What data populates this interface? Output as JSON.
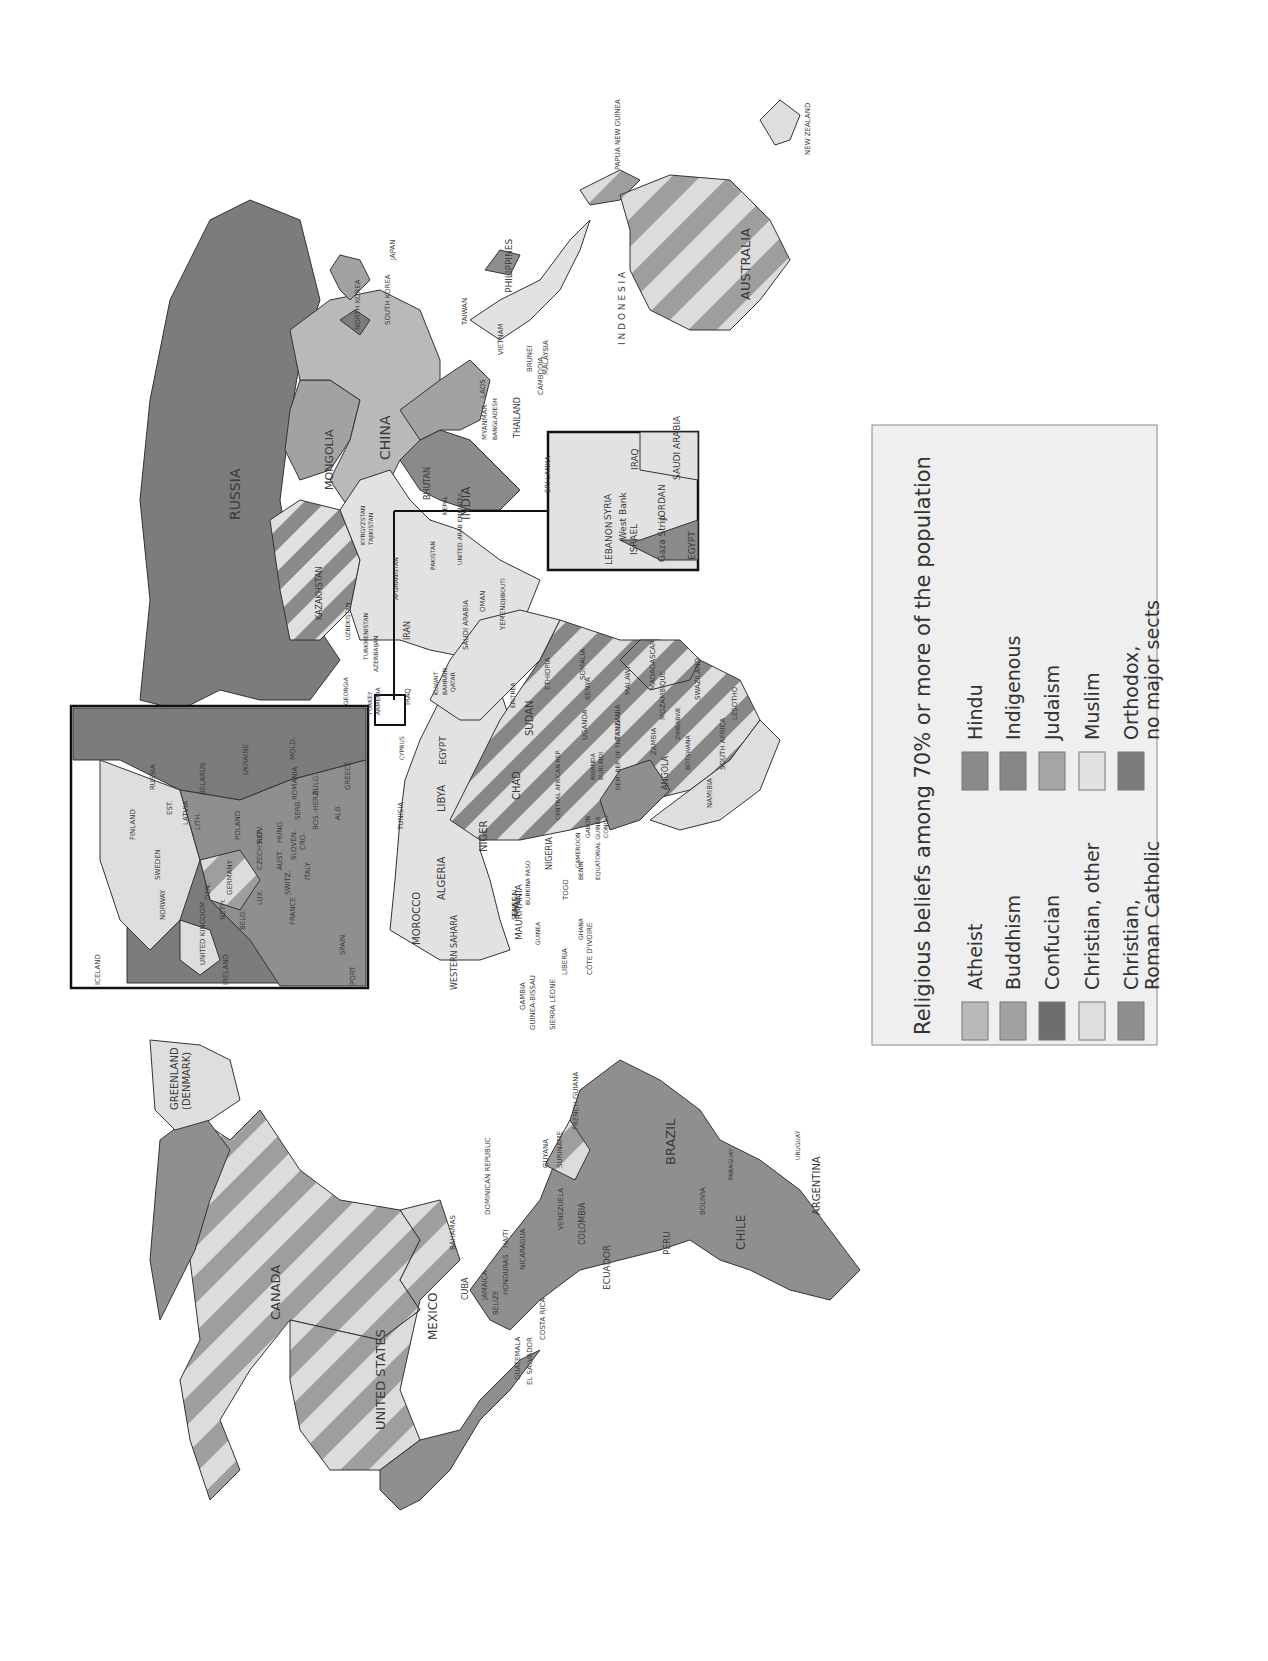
{
  "colors": {
    "atheist": "#b9b9b9",
    "buddhism": "#a2a2a2",
    "confucian": "#6e6e6e",
    "christian_other": "#dedede",
    "roman_catholic": "#8f8f8f",
    "hindu": "#8a8a8a",
    "indigenous": "#868686",
    "judaism": "#a5a5a5",
    "muslim": "#e2e2e2",
    "orthodox": "#7c7c7c",
    "stripe_a": "#9e9e9e",
    "stripe_b": "#dcdcdc",
    "legend_bg": "#efefef",
    "border": "#222222"
  },
  "legend": {
    "title": "Religious beliefs among 70% or more of the population",
    "items": [
      {
        "key": "atheist",
        "label": "Atheist"
      },
      {
        "key": "buddhism",
        "label": "Buddhism"
      },
      {
        "key": "confucian",
        "label": "Confucian"
      },
      {
        "key": "christian_other",
        "label": "Christian, other"
      },
      {
        "key": "roman_catholic",
        "label": "Christian,",
        "label2": "Roman Catholic"
      },
      {
        "key": "hindu",
        "label": "Hindu"
      },
      {
        "key": "indigenous",
        "label": "Indigenous"
      },
      {
        "key": "judaism",
        "label": "Judaism"
      },
      {
        "key": "muslim",
        "label": "Muslim"
      },
      {
        "key": "orthodox",
        "label": "Orthodox,",
        "label2": "no major sects"
      }
    ]
  },
  "countries": {
    "canada": "CANADA",
    "united_states": "UNITED STATES",
    "mexico": "MEXICO",
    "greenland": "GREENLAND",
    "greenland2": "(DENMARK)",
    "cuba": "CUBA",
    "bahamas": "BAHAMAS",
    "dominican_republic": "DOMINICAN REPUBLIC",
    "jamaica": "JAMAICA",
    "haiti": "HAITI",
    "honduras": "HONDURAS",
    "belize": "BELIZE",
    "nicaragua": "NICARAGUA",
    "guatemala": "GUATEMALA",
    "el_salvador": "EL SALVADOR",
    "costa_rica": "COSTA RICA",
    "panama": "PANAMA",
    "venezuela": "VENEZUELA",
    "guyana": "GUYANA",
    "suriname": "SURINAME",
    "french_guiana": "FRENCH GUIANA",
    "colombia": "COLOMBIA",
    "ecuador": "ECUADOR",
    "peru": "PERU",
    "brazil": "BRAZIL",
    "bolivia": "BOLIVIA",
    "paraguay": "PARAGUAY",
    "chile": "CHILE",
    "argentina": "ARGENTINA",
    "uruguay": "URUGUAY",
    "russia": "RUSSIA",
    "kazakhstan": "KAZAKHSTAN",
    "mongolia": "MONGOLIA",
    "china": "CHINA",
    "north_korea": "NORTH KOREA",
    "south_korea": "SOUTH KOREA",
    "japan": "JAPAN",
    "taiwan": "TAIWAN",
    "philippines": "PHILIPPINES",
    "vietnam": "VIETNAM",
    "laos": "LAOS",
    "cambodia": "CAMBODIA",
    "thailand": "THAILAND",
    "myanmar": "MYANMAR",
    "bangladesh": "BANGLADESH",
    "bhutan": "BHUTAN",
    "nepal": "NEPAL",
    "india": "INDIA",
    "sri_lanka": "SRI LANKA",
    "brunei": "BRUNEI",
    "malaysia": "MALAYSIA",
    "indonesia": "I N D O N E S I A",
    "papua_new_guinea": "PAPUA NEW GUINEA",
    "australia": "AUSTRALIA",
    "new_zealand": "NEW ZEALAND",
    "kyrgyzstan": "KYRGYZSTAN",
    "tajikistan": "TAJIKISTAN",
    "uzbekistan": "UZBEKISTAN",
    "turkmenistan": "TURKMENISTAN",
    "azerbaijan": "AZERBAIJAN",
    "afghanistan": "AFGHANISTAN",
    "pakistan": "PAKISTAN",
    "iran": "IRAN",
    "iraq": "IRAQ",
    "georgia": "GEORGIA",
    "turkey": "TURKEY",
    "armenia": "ARMENIA",
    "kuwait": "KUWAIT",
    "bahrain": "BAHRAIN",
    "qatar": "QATAR",
    "uae": "UNITED ARAB EMIRATES",
    "oman": "OMAN",
    "yemen": "YEMEN",
    "saudi_arabia": "SAUDI ARABIA",
    "djibouti": "DJIBOUTI",
    "cyprus": "CYPRUS",
    "morocco": "MOROCCO",
    "western_sahara": "WESTERN SAHARA",
    "algeria": "ALGERIA",
    "tunisia": "TUNISIA",
    "libya": "LIBYA",
    "egypt": "EGYPT",
    "sudan": "SUDAN",
    "chad": "CHAD",
    "niger": "NIGER",
    "mali": "MALI",
    "mauritania": "MAURITANIA",
    "senegal": "SENEGAL",
    "gambia": "GAMBIA",
    "guinea_bissau": "GUINEA-BISSAU",
    "guinea": "GUINEA",
    "sierra_leone": "SIERRA LEONE",
    "liberia": "LIBERIA",
    "cote_divoire": "CÔTE D'IVOIRE",
    "ghana": "GHANA",
    "togo": "TOGO",
    "benin": "BENIN",
    "burkina_faso": "BURKINA FASO",
    "nigeria": "NIGERIA",
    "cameroon": "CAMEROON",
    "equatorial_guinea": "EQUATORIAL GUINEA",
    "gabon": "GABON",
    "congo": "CONGO",
    "car": "CENTRAL AFRICAN REP.",
    "eritrea": "ERITREA",
    "ethiopia": "ETHIOPIA",
    "somalia": "SOMALIA",
    "kenya": "KENYA",
    "uganda": "UGANDA",
    "rwanda": "RWANDA",
    "burundi": "BURUNDI",
    "drc": "DEM. REP. OF THE CONGO",
    "tanzania": "TANZANIA",
    "angola": "ANGOLA",
    "zambia": "ZAMBIA",
    "malawi": "MALAWI",
    "mozambique": "MOZAMBIQUE",
    "madagascar": "MADAGASCAR",
    "zimbabwe": "ZIMBABWE",
    "namibia": "NAMIBIA",
    "botswana": "BOTSWANA",
    "south_africa": "SOUTH AFRICA",
    "swaziland": "SWAZILAND",
    "lesotho": "LESOTHO"
  },
  "europe_inset": {
    "russia": "RUSSIA",
    "finland": "FINLAND",
    "sweden": "SWEDEN",
    "norway": "NORWAY",
    "iceland": "ICELAND",
    "estonia": "EST.",
    "latvia": "LATVIA",
    "lithuania": "LITH.",
    "belarus": "BELARUS",
    "ukraine": "UKRAINE",
    "moldova": "MOLD.",
    "poland": "POLAND",
    "germany": "GERMANY",
    "denmark": "DEN.",
    "netherlands": "NETH.",
    "belgium": "BELG.",
    "luxembourg": "LUX.",
    "czech": "CZECH REP.",
    "slovakia": "SLOV.",
    "hungary": "HUNG.",
    "austria": "AUST.",
    "switzerland": "SWITZ.",
    "slovenia": "SLOVEN.",
    "croatia": "CRO.",
    "bosnia": "BOS.-HERZ.",
    "serbia": "SERB.",
    "albania": "ALB.",
    "romania": "ROMANIA",
    "bulgaria": "BULG.",
    "greece": "GREECE",
    "italy": "ITALY",
    "france": "FRANCE",
    "spain": "SPAIN",
    "portugal": "PORT.",
    "united_kingdom": "UNITED KINGDOM",
    "ireland": "IRELAND"
  },
  "mideast_inset": {
    "lebanon": "LEBANON",
    "syria": "SYRIA",
    "iraq": "IRAQ",
    "israel": "ISRAEL",
    "west_bank": "West Bank",
    "gaza": "Gaza Strip",
    "jordan": "JORDAN",
    "saudi_arabia": "SAUDI ARABIA",
    "egypt": "EGYPT"
  }
}
